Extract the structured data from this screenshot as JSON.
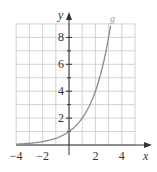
{
  "chart_data": {
    "type": "line",
    "title": "",
    "xlabel": "x",
    "ylabel": "y",
    "xlim": [
      -4,
      5
    ],
    "ylim": [
      0,
      9
    ],
    "grid": true,
    "x_ticks": [
      -4,
      -2,
      2,
      4
    ],
    "x_tick_labels": [
      "−4",
      "−2",
      "2",
      "4"
    ],
    "y_ticks": [
      2,
      4,
      6,
      8
    ],
    "y_tick_labels": [
      "2",
      "4",
      "6",
      "8"
    ],
    "series": [
      {
        "name": "g",
        "function": "2^x",
        "x": [
          -4,
          -3,
          -2,
          -1,
          0,
          1,
          2,
          3,
          3.17
        ],
        "y": [
          0.0625,
          0.125,
          0.25,
          0.5,
          1,
          2,
          4,
          8,
          9
        ],
        "color": "#8a8a8a"
      }
    ],
    "annotations": [
      {
        "text": "g",
        "x": 3.2,
        "y": 9.2
      }
    ]
  },
  "colors": {
    "grid": "#c8c8c8",
    "axis": "#333333",
    "curve": "#8a8a8a"
  }
}
